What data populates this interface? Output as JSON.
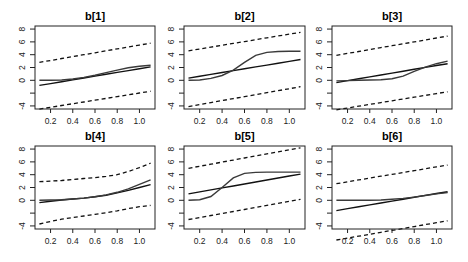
{
  "figure": {
    "layout": "2x3 grid of line panels"
  },
  "chart_data": [
    {
      "type": "line",
      "title": "b[1]",
      "xlabel": "",
      "ylabel": "",
      "xlim": [
        0.06,
        1.14
      ],
      "ylim": [
        -4.48,
        8.48
      ],
      "grid": false,
      "xticks": [
        0.2,
        0.4,
        0.6,
        0.8,
        1.0
      ],
      "xtick_labels": [
        "0.2",
        "0.4",
        "0.6",
        "0.8",
        "1.0"
      ],
      "yticks": [
        -4,
        -2,
        0,
        2,
        4,
        6,
        8
      ],
      "ytick_labels": [
        "-4",
        "",
        "0",
        "2",
        "4",
        "6",
        "8"
      ],
      "x": [
        0.1,
        0.2,
        0.3,
        0.4,
        0.5,
        0.6,
        0.7,
        0.8,
        0.9,
        1.0,
        1.1
      ],
      "series": [
        {
          "name": "upper bound",
          "style": "dashed",
          "values": [
            2.8,
            3.1,
            3.4,
            3.7,
            4.0,
            4.3,
            4.6,
            4.9,
            5.2,
            5.5,
            5.8
          ]
        },
        {
          "name": "lower bound",
          "style": "dashed",
          "values": [
            -4.5,
            -4.22,
            -3.94,
            -3.66,
            -3.38,
            -3.1,
            -2.82,
            -2.54,
            -2.26,
            -1.98,
            -1.7
          ]
        },
        {
          "name": "linear estimate",
          "style": "line",
          "values": [
            -0.8,
            -0.51,
            -0.22,
            0.07,
            0.36,
            0.65,
            0.94,
            1.23,
            1.52,
            1.81,
            2.1
          ]
        },
        {
          "name": "true curve",
          "style": "curve",
          "values": [
            0,
            0,
            0.05,
            0.2,
            0.45,
            0.8,
            1.2,
            1.6,
            1.95,
            2.2,
            2.35
          ]
        }
      ]
    },
    {
      "type": "line",
      "title": "b[2]",
      "xlabel": "",
      "ylabel": "",
      "xlim": [
        0.06,
        1.14
      ],
      "ylim": [
        -4.48,
        8.48
      ],
      "grid": false,
      "xticks": [
        0.2,
        0.4,
        0.6,
        0.8,
        1.0
      ],
      "xtick_labels": [
        "0.2",
        "0.4",
        "0.6",
        "0.8",
        "1.0"
      ],
      "yticks": [
        -4,
        -2,
        0,
        2,
        4,
        6,
        8
      ],
      "ytick_labels": [
        "-4",
        "",
        "0",
        "2",
        "4",
        "6",
        "8"
      ],
      "x": [
        0.1,
        0.2,
        0.3,
        0.4,
        0.5,
        0.6,
        0.7,
        0.8,
        0.9,
        1.0,
        1.1
      ],
      "series": [
        {
          "name": "upper bound",
          "style": "dashed",
          "values": [
            4.6,
            4.89,
            5.18,
            5.47,
            5.76,
            6.05,
            6.34,
            6.63,
            6.92,
            7.21,
            7.5
          ]
        },
        {
          "name": "lower bound",
          "style": "dashed",
          "values": [
            -4.1,
            -3.79,
            -3.48,
            -3.17,
            -2.86,
            -2.55,
            -2.24,
            -1.93,
            -1.62,
            -1.31,
            -1.0
          ]
        },
        {
          "name": "linear estimate",
          "style": "line",
          "values": [
            0.35,
            0.64,
            0.93,
            1.22,
            1.51,
            1.8,
            2.09,
            2.38,
            2.67,
            2.96,
            3.25
          ]
        },
        {
          "name": "true curve",
          "style": "curve",
          "values": [
            0,
            0.05,
            0.3,
            0.75,
            1.6,
            2.8,
            3.9,
            4.35,
            4.5,
            4.55,
            4.55
          ]
        }
      ]
    },
    {
      "type": "line",
      "title": "b[3]",
      "xlabel": "",
      "ylabel": "",
      "xlim": [
        0.06,
        1.14
      ],
      "ylim": [
        -4.48,
        8.48
      ],
      "grid": false,
      "xticks": [
        0.2,
        0.4,
        0.6,
        0.8,
        1.0
      ],
      "xtick_labels": [
        "0.2",
        "0.4",
        "0.6",
        "0.8",
        "1.0"
      ],
      "yticks": [
        -4,
        -2,
        0,
        2,
        4,
        6,
        8
      ],
      "ytick_labels": [
        "-4",
        "",
        "0",
        "2",
        "4",
        "6",
        "8"
      ],
      "x": [
        0.1,
        0.2,
        0.3,
        0.4,
        0.5,
        0.6,
        0.7,
        0.8,
        0.9,
        1.0,
        1.1
      ],
      "series": [
        {
          "name": "upper bound",
          "style": "dashed",
          "values": [
            3.9,
            4.2,
            4.5,
            4.8,
            5.1,
            5.4,
            5.7,
            6.0,
            6.3,
            6.6,
            6.9
          ]
        },
        {
          "name": "lower bound",
          "style": "dashed",
          "values": [
            -4.6,
            -4.32,
            -4.04,
            -3.76,
            -3.48,
            -3.2,
            -2.92,
            -2.64,
            -2.36,
            -2.08,
            -1.8
          ]
        },
        {
          "name": "linear estimate",
          "style": "line",
          "values": [
            -0.35,
            -0.05,
            0.24,
            0.54,
            0.83,
            1.13,
            1.42,
            1.72,
            2.01,
            2.31,
            2.6
          ]
        },
        {
          "name": "true curve",
          "style": "curve",
          "values": [
            -0.1,
            -0.05,
            0.0,
            0.05,
            0.1,
            0.25,
            0.65,
            1.4,
            2.05,
            2.6,
            3.0
          ]
        }
      ]
    },
    {
      "type": "line",
      "title": "b[4]",
      "xlabel": "",
      "ylabel": "",
      "xlim": [
        0.06,
        1.14
      ],
      "ylim": [
        -4.48,
        8.48
      ],
      "grid": false,
      "xticks": [
        0.2,
        0.4,
        0.6,
        0.8,
        1.0
      ],
      "xtick_labels": [
        "0.2",
        "0.4",
        "0.6",
        "0.8",
        "1.0"
      ],
      "yticks": [
        -4,
        -2,
        0,
        2,
        4,
        6,
        8
      ],
      "ytick_labels": [
        "-4",
        "",
        "0",
        "2",
        "4",
        "6",
        "8"
      ],
      "x": [
        0.1,
        0.2,
        0.3,
        0.4,
        0.5,
        0.6,
        0.7,
        0.8,
        0.9,
        1.0,
        1.1
      ],
      "series": [
        {
          "name": "upper bound",
          "style": "dashed",
          "values": [
            2.9,
            3.0,
            3.1,
            3.25,
            3.4,
            3.55,
            3.75,
            4.0,
            4.5,
            5.1,
            5.8
          ]
        },
        {
          "name": "lower bound",
          "style": "dashed",
          "values": [
            -3.7,
            -3.3,
            -2.95,
            -2.7,
            -2.45,
            -2.2,
            -1.95,
            -1.65,
            -1.3,
            -1.0,
            -0.8
          ]
        },
        {
          "name": "linear estimate",
          "style": "line",
          "values": [
            -0.35,
            -0.15,
            0.05,
            0.2,
            0.35,
            0.55,
            0.8,
            1.15,
            1.55,
            2.0,
            2.45
          ]
        },
        {
          "name": "true curve",
          "style": "curve",
          "values": [
            0,
            0.05,
            0.1,
            0.2,
            0.35,
            0.55,
            0.85,
            1.25,
            1.8,
            2.5,
            3.2
          ]
        }
      ]
    },
    {
      "type": "line",
      "title": "b[5]",
      "xlabel": "",
      "ylabel": "",
      "xlim": [
        0.06,
        1.14
      ],
      "ylim": [
        -4.48,
        8.48
      ],
      "grid": false,
      "xticks": [
        0.2,
        0.4,
        0.6,
        0.8,
        1.0
      ],
      "xtick_labels": [
        "0.2",
        "0.4",
        "0.6",
        "0.8",
        "1.0"
      ],
      "yticks": [
        -4,
        -2,
        0,
        2,
        4,
        6,
        8
      ],
      "ytick_labels": [
        "-4",
        "",
        "0",
        "2",
        "4",
        "6",
        "8"
      ],
      "x": [
        0.1,
        0.2,
        0.3,
        0.4,
        0.5,
        0.6,
        0.7,
        0.8,
        0.9,
        1.0,
        1.1
      ],
      "series": [
        {
          "name": "upper bound",
          "style": "dashed",
          "values": [
            5.0,
            5.32,
            5.64,
            5.96,
            6.28,
            6.6,
            6.92,
            7.24,
            7.56,
            7.88,
            8.2
          ]
        },
        {
          "name": "lower bound",
          "style": "dashed",
          "values": [
            -3.0,
            -2.69,
            -2.37,
            -2.06,
            -1.74,
            -1.43,
            -1.11,
            -0.8,
            -0.48,
            -0.17,
            0.15
          ]
        },
        {
          "name": "linear estimate",
          "style": "line",
          "values": [
            1.0,
            1.31,
            1.62,
            1.93,
            2.24,
            2.55,
            2.86,
            3.17,
            3.48,
            3.79,
            4.1
          ]
        },
        {
          "name": "true curve",
          "style": "curve",
          "values": [
            0,
            0.1,
            0.6,
            2.0,
            3.5,
            4.2,
            4.35,
            4.4,
            4.4,
            4.4,
            4.4
          ]
        }
      ]
    },
    {
      "type": "line",
      "title": "b[6]",
      "xlabel": "",
      "ylabel": "",
      "xlim": [
        0.06,
        1.14
      ],
      "ylim": [
        -4.48,
        8.48
      ],
      "grid": false,
      "xticks": [
        0.2,
        0.4,
        0.6,
        0.8,
        1.0
      ],
      "xtick_labels": [
        "0.2",
        "0.4",
        "0.6",
        "0.8",
        "1.0"
      ],
      "yticks": [
        -4,
        -2,
        0,
        2,
        4,
        6,
        8
      ],
      "ytick_labels": [
        "-4",
        "",
        "0",
        "2",
        "4",
        "6",
        "8"
      ],
      "x": [
        0.1,
        0.2,
        0.3,
        0.4,
        0.5,
        0.6,
        0.7,
        0.8,
        0.9,
        1.0,
        1.1
      ],
      "series": [
        {
          "name": "upper bound",
          "style": "dashed",
          "values": [
            2.6,
            2.89,
            3.18,
            3.47,
            3.76,
            4.05,
            4.34,
            4.63,
            4.92,
            5.21,
            5.5
          ]
        },
        {
          "name": "lower bound",
          "style": "dashed",
          "values": [
            -6.2,
            -5.9,
            -5.6,
            -5.3,
            -5.0,
            -4.7,
            -4.4,
            -4.1,
            -3.8,
            -3.5,
            -3.2
          ]
        },
        {
          "name": "linear estimate",
          "style": "line",
          "values": [
            -1.6,
            -1.3,
            -1.01,
            -0.71,
            -0.42,
            -0.12,
            0.17,
            0.47,
            0.76,
            1.06,
            1.35
          ]
        },
        {
          "name": "true curve",
          "style": "curve",
          "values": [
            0,
            0,
            0,
            0,
            0.05,
            0.15,
            0.3,
            0.5,
            0.75,
            1.0,
            1.2
          ]
        }
      ]
    }
  ]
}
